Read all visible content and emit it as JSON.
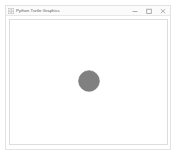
{
  "window": {
    "title": "Python Turtle Graphics",
    "app_icon": "turtle-app-icon",
    "controls": [
      {
        "name": "minimize",
        "label": "–",
        "icon": "minimize-icon"
      },
      {
        "name": "maximize",
        "label": "□",
        "icon": "maximize-icon"
      },
      {
        "name": "close",
        "label": "×",
        "icon": "close-icon"
      }
    ]
  },
  "canvas": {
    "background_color": "#ffffff",
    "border_color": "#dddddd",
    "width": 159,
    "height": 126
  },
  "drawing": {
    "shape_type": "circle",
    "fill_color": "#808080",
    "outline_color": "#757575",
    "center_x": 89,
    "center_y": 74,
    "radius": 10.5,
    "pen_color": "#808080"
  }
}
